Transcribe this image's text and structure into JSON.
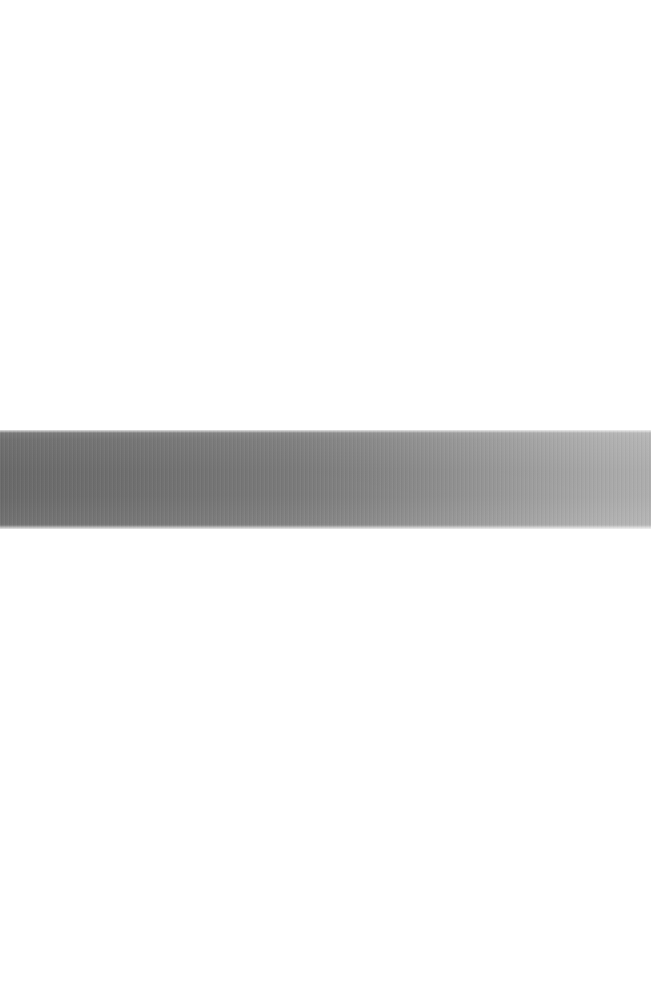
{
  "page": {
    "name": "scanned-blank-page-with-gray-band",
    "width_px": 651,
    "height_px": 981,
    "background_color": "#ffffff",
    "text_content": "",
    "notes_visible": ""
  },
  "band": {
    "label": "",
    "x_px": 0,
    "y_px": 430,
    "width_px": 651,
    "height_px": 99,
    "gradient_direction": "left-to-right",
    "color_left": "#6d6d6d",
    "color_mid": "#7f7f7f",
    "color_right": "#b3b3b3",
    "texture": "fine-vertical-scan-striping"
  },
  "regions": {
    "upper_blank_label": "",
    "lower_blank_label": "",
    "upper_blank_height_px": 430,
    "lower_blank_height_px": 452
  },
  "colors": {
    "paper": "#ffffff",
    "edge_shadow": "#f3f3f3",
    "band_dark": "#6d6d6d",
    "band_light": "#b3b3b3"
  }
}
